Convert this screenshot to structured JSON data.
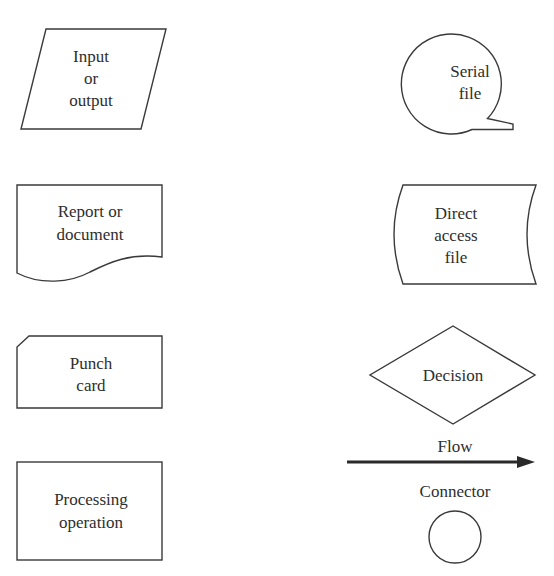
{
  "diagram": {
    "type": "flowchart-symbol-legend",
    "colors": {
      "stroke": "#3a3a3a",
      "text": "#2e2e2e",
      "background": "#ffffff"
    },
    "symbols": {
      "input_output": {
        "line1": "Input",
        "line2": "or",
        "line3": "output"
      },
      "serial_file": {
        "line1": "Serial",
        "line2": "file"
      },
      "report_document": {
        "line1": "Report or",
        "line2": "document"
      },
      "direct_access_file": {
        "line1": "Direct",
        "line2": "access",
        "line3": "file"
      },
      "punch_card": {
        "line1": "Punch",
        "line2": "card"
      },
      "decision": {
        "line1": "Decision"
      },
      "flow": {
        "label": "Flow"
      },
      "connector": {
        "label": "Connector"
      },
      "processing_operation": {
        "line1": "Processing",
        "line2": "operation"
      }
    }
  }
}
